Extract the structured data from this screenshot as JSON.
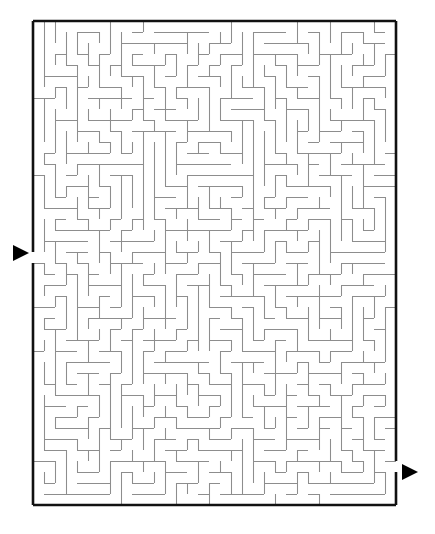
{
  "figure": {
    "kind": "maze-puzzle",
    "background_color": "#ffffff"
  },
  "maze": {
    "cols": 33,
    "rows": 44,
    "cell_px": 11,
    "origin_x": 33,
    "origin_y": 21,
    "width_px": 363,
    "height_px": 484,
    "border_color": "#111111",
    "border_width": 2.6,
    "wall_color": "#8d8d8d",
    "wall_width": 1.05,
    "entrance": {
      "side": "left",
      "row": 21,
      "label": "start"
    },
    "exit": {
      "side": "right",
      "row": 40,
      "label": "finish"
    },
    "seed": 20240517,
    "algorithm": "recursive-backtracker",
    "hwalls_extra": [
      [
        0,
        1,
        8
      ],
      [
        0,
        12,
        16
      ],
      [
        0,
        22,
        27
      ],
      [
        0,
        29,
        33
      ],
      [
        1,
        2,
        4
      ],
      [
        1,
        6,
        9
      ],
      [
        1,
        14,
        19
      ],
      [
        1,
        25,
        28
      ],
      [
        2,
        1,
        3
      ],
      [
        2,
        5,
        7
      ],
      [
        2,
        10,
        13
      ],
      [
        2,
        20,
        24
      ],
      [
        2,
        30,
        32
      ],
      [
        3,
        3,
        11
      ],
      [
        3,
        16,
        21
      ],
      [
        3,
        26,
        31
      ],
      [
        4,
        1,
        6
      ],
      [
        4,
        8,
        14
      ],
      [
        4,
        18,
        23
      ],
      [
        4,
        28,
        33
      ],
      [
        5,
        2,
        5
      ],
      [
        5,
        9,
        12
      ],
      [
        5,
        15,
        20
      ],
      [
        5,
        24,
        29
      ],
      [
        6,
        0,
        4
      ],
      [
        6,
        7,
        10
      ],
      [
        6,
        13,
        17
      ],
      [
        6,
        22,
        26
      ],
      [
        6,
        30,
        33
      ],
      [
        7,
        3,
        8
      ],
      [
        7,
        11,
        15
      ],
      [
        7,
        19,
        24
      ],
      [
        7,
        27,
        31
      ],
      [
        8,
        1,
        5
      ],
      [
        8,
        9,
        13
      ],
      [
        8,
        17,
        22
      ],
      [
        8,
        25,
        30
      ],
      [
        9,
        2,
        7
      ],
      [
        9,
        10,
        14
      ],
      [
        9,
        18,
        21
      ],
      [
        9,
        26,
        33
      ],
      [
        10,
        0,
        3
      ],
      [
        10,
        6,
        11
      ],
      [
        10,
        15,
        19
      ],
      [
        10,
        23,
        28
      ],
      [
        11,
        4,
        9
      ],
      [
        11,
        12,
        16
      ],
      [
        11,
        20,
        25
      ],
      [
        11,
        29,
        32
      ],
      [
        12,
        1,
        6
      ],
      [
        12,
        8,
        13
      ],
      [
        12,
        17,
        23
      ],
      [
        12,
        27,
        33
      ],
      [
        13,
        3,
        7
      ],
      [
        13,
        10,
        15
      ],
      [
        13,
        19,
        24
      ],
      [
        13,
        26,
        30
      ],
      [
        14,
        0,
        5
      ],
      [
        14,
        8,
        12
      ],
      [
        14,
        16,
        21
      ],
      [
        14,
        25,
        29
      ],
      [
        15,
        2,
        6
      ],
      [
        15,
        11,
        14
      ],
      [
        15,
        18,
        23
      ],
      [
        15,
        28,
        33
      ],
      [
        16,
        1,
        4
      ],
      [
        16,
        7,
        13
      ],
      [
        16,
        15,
        20
      ],
      [
        16,
        24,
        31
      ],
      [
        17,
        3,
        9
      ],
      [
        17,
        12,
        17
      ],
      [
        17,
        21,
        26
      ],
      [
        17,
        30,
        33
      ],
      [
        18,
        0,
        6
      ],
      [
        18,
        10,
        14
      ],
      [
        18,
        19,
        25
      ],
      [
        18,
        27,
        32
      ],
      [
        19,
        2,
        8
      ],
      [
        19,
        13,
        18
      ],
      [
        19,
        22,
        28
      ],
      [
        19,
        30,
        33
      ],
      [
        20,
        1,
        5
      ],
      [
        20,
        9,
        12
      ],
      [
        20,
        16,
        21
      ],
      [
        20,
        26,
        31
      ],
      [
        21,
        4,
        10
      ],
      [
        21,
        14,
        19
      ],
      [
        21,
        23,
        27
      ],
      [
        21,
        29,
        33
      ],
      [
        22,
        0,
        3
      ],
      [
        22,
        7,
        11
      ],
      [
        22,
        17,
        22
      ],
      [
        22,
        25,
        30
      ],
      [
        23,
        2,
        8
      ],
      [
        23,
        12,
        16
      ],
      [
        23,
        20,
        26
      ],
      [
        23,
        28,
        33
      ],
      [
        24,
        1,
        6
      ],
      [
        24,
        10,
        15
      ],
      [
        24,
        18,
        24
      ],
      [
        24,
        27,
        31
      ],
      [
        25,
        3,
        9
      ],
      [
        25,
        13,
        17
      ],
      [
        25,
        22,
        28
      ],
      [
        25,
        30,
        33
      ],
      [
        26,
        0,
        5
      ],
      [
        26,
        8,
        14
      ],
      [
        26,
        19,
        23
      ],
      [
        26,
        26,
        32
      ],
      [
        27,
        2,
        7
      ],
      [
        27,
        11,
        16
      ],
      [
        27,
        21,
        27
      ],
      [
        27,
        29,
        33
      ],
      [
        28,
        1,
        4
      ],
      [
        28,
        9,
        13
      ],
      [
        28,
        17,
        22
      ],
      [
        28,
        25,
        30
      ],
      [
        29,
        3,
        8
      ],
      [
        29,
        12,
        18
      ],
      [
        29,
        20,
        26
      ],
      [
        29,
        28,
        33
      ],
      [
        30,
        0,
        6
      ],
      [
        30,
        10,
        15
      ],
      [
        30,
        19,
        24
      ],
      [
        30,
        27,
        31
      ],
      [
        31,
        2,
        9
      ],
      [
        31,
        13,
        17
      ],
      [
        31,
        21,
        28
      ],
      [
        31,
        30,
        33
      ],
      [
        32,
        1,
        5
      ],
      [
        32,
        8,
        12
      ],
      [
        32,
        16,
        23
      ],
      [
        32,
        26,
        32
      ],
      [
        33,
        4,
        10
      ],
      [
        33,
        14,
        19
      ],
      [
        33,
        22,
        27
      ],
      [
        33,
        29,
        33
      ],
      [
        34,
        0,
        3
      ],
      [
        34,
        7,
        13
      ],
      [
        34,
        18,
        24
      ],
      [
        34,
        26,
        31
      ],
      [
        35,
        2,
        8
      ],
      [
        35,
        11,
        16
      ],
      [
        35,
        20,
        25
      ],
      [
        35,
        28,
        33
      ],
      [
        36,
        1,
        6
      ],
      [
        36,
        10,
        14
      ],
      [
        36,
        17,
        23
      ],
      [
        36,
        27,
        32
      ],
      [
        37,
        3,
        9
      ],
      [
        37,
        12,
        18
      ],
      [
        37,
        21,
        26
      ],
      [
        37,
        29,
        33
      ],
      [
        38,
        0,
        5
      ],
      [
        38,
        8,
        13
      ],
      [
        38,
        19,
        24
      ],
      [
        38,
        25,
        30
      ],
      [
        39,
        2,
        7
      ],
      [
        39,
        11,
        17
      ],
      [
        39,
        22,
        28
      ],
      [
        39,
        30,
        33
      ],
      [
        40,
        1,
        4
      ],
      [
        40,
        9,
        15
      ],
      [
        40,
        18,
        23
      ],
      [
        40,
        26,
        31
      ],
      [
        41,
        3,
        10
      ],
      [
        41,
        13,
        19
      ],
      [
        41,
        21,
        27
      ],
      [
        41,
        29,
        33
      ],
      [
        42,
        0,
        6
      ],
      [
        42,
        12,
        16
      ],
      [
        42,
        20,
        25
      ],
      [
        42,
        28,
        32
      ],
      [
        43,
        2,
        9
      ],
      [
        43,
        14,
        18
      ],
      [
        43,
        23,
        29
      ],
      [
        43,
        30,
        33
      ]
    ]
  },
  "arrows": {
    "color": "#000000",
    "entrance": {
      "x": 12,
      "y": 244,
      "w": 16,
      "h": 16,
      "direction": "right",
      "name": "start-arrow"
    },
    "exit": {
      "x": 401,
      "y": 463,
      "w": 16,
      "h": 16,
      "direction": "right",
      "name": "finish-arrow"
    }
  }
}
